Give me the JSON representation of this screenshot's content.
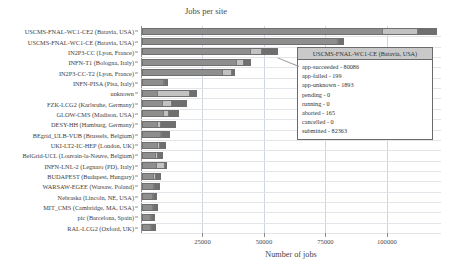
{
  "chart_data": {
    "type": "bar",
    "orientation": "horizontal",
    "stacked": true,
    "title": "Jobs per site",
    "xlabel": "Number of jobs",
    "ylabel": "",
    "xlim": [
      0,
      122000
    ],
    "xticks": [
      25000,
      50000,
      75000,
      100000
    ],
    "xtick_labels": [
      "25000",
      "50000",
      "75000",
      "100000"
    ],
    "grid": true,
    "grid_axis": "both",
    "legend_position": "none",
    "categories": [
      "USCMS-FNAL-WC1-CE2 (Batavia, USA)",
      "USCMS-FNAL-WC1-CE (Batavia, USA)",
      "IN2P3-CC (Lyon, France)",
      "INFN-T1 (Bologna, Italy)",
      "IN2P3-CC-T2 (Lyon, France)",
      "INFN-PISA (Pisa, Italy)",
      "unknown",
      "FZK-LCG2 (Karlsruhe, Germany)",
      "GLOW-CMS (Madison, USA)",
      "DESY-HH (Hamburg, Germany)",
      "BEgrid_ULB-VUB (Brussels, Belgium)",
      "UKI-LT2-IC-HEP (London, UK)",
      "BelGrid-UCL (Louvain-la-Neuve, Belgium)",
      "INFN-LNL-2 (Legnaro (PD), Italy)",
      "BUDAPEST (Budapest, Hungary)",
      "WARSAW-EGEE (Warsaw, Poland)",
      "Nebraska (Lincoln, NE, USA)",
      "MIT_CMS (Cambridge, MA, USA)",
      "pic (Barcelona, Spain)",
      "RAL-LCG2 (Oxford, UK)"
    ],
    "series": [
      {
        "name": "app-succeeded",
        "color": "#8e8e8e",
        "values": [
          98000,
          80086,
          44000,
          38500,
          33000,
          8800,
          6000,
          8000,
          8500,
          6000,
          7400,
          6400,
          5600,
          5800,
          4600,
          4500,
          4200,
          4100,
          3700,
          3300
        ]
      },
      {
        "name": "app-failed",
        "color": "#c2c2c2",
        "values": [
          14000,
          199,
          4800,
          3000,
          3400,
          600,
          13500,
          4000,
          2200,
          1400,
          600,
          700,
          500,
          3500,
          700,
          600,
          600,
          500,
          400,
          400
        ]
      },
      {
        "name": "app-unknown",
        "color": "#6f6f6f",
        "values": [
          8000,
          1893,
          6500,
          3000,
          1500,
          1000,
          3000,
          6200,
          4500,
          6500,
          3500,
          2800,
          2300,
          1000,
          2300,
          2200,
          1500,
          1800,
          1200,
          1800
        ]
      }
    ],
    "totals": [
      120000,
      82178,
      55300,
      44500,
      37900,
      10400,
      22500,
      18200,
      15200,
      13900,
      11500,
      9900,
      8400,
      10300,
      7600,
      7300,
      6300,
      6400,
      5300,
      5500
    ]
  },
  "tooltip": {
    "visible": true,
    "title": "USCMS-FNAL-WC1-CE (Batavia, USA)",
    "rows": [
      "app-succeeded - 80086",
      "app-failed - 199",
      "app-unknown - 1893",
      "pending - 0",
      "running - 0",
      "aborted - 165",
      "cancelled - 0",
      "submitted - 82363"
    ]
  },
  "colors": {
    "succeeded": "#8e8e8e",
    "failed": "#c2c2c2",
    "unknown": "#6f6f6f",
    "grid": "#cfd6dd",
    "axis": "#8d8d8d",
    "tooltip_header": "#c9c9c9",
    "text": "#3d3d3d"
  }
}
